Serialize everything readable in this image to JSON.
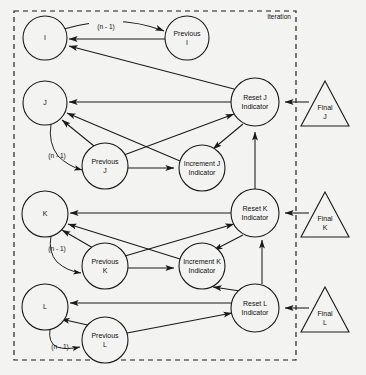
{
  "diagram": {
    "title_label": "Iteration",
    "background_color": "#f3f3f1",
    "stroke_color": "#1a1a1a",
    "type": "flow-network",
    "boundary": {
      "name": "Iteration",
      "x": 14,
      "y": 11,
      "width": 282,
      "height": 349,
      "style": "dashed"
    },
    "nodes": [
      {
        "id": "i",
        "label": "I",
        "shape": "circle",
        "cx": 45,
        "cy": 38,
        "r": 22
      },
      {
        "id": "prev_i",
        "label": "Previous\nI",
        "shape": "circle",
        "cx": 187,
        "cy": 38,
        "r": 22
      },
      {
        "id": "j",
        "label": "J",
        "shape": "circle",
        "cx": 45,
        "cy": 103,
        "r": 22
      },
      {
        "id": "prev_j",
        "label": "Previous\nJ",
        "shape": "circle",
        "cx": 105,
        "cy": 166,
        "r": 23
      },
      {
        "id": "inc_j",
        "label": "Increment J\nIndicator",
        "shape": "circle",
        "cx": 202,
        "cy": 168,
        "r": 23
      },
      {
        "id": "reset_j",
        "label": "Reset J\nIndicator",
        "shape": "circle",
        "cx": 255,
        "cy": 102,
        "r": 24
      },
      {
        "id": "final_j",
        "label": "Final\nJ",
        "shape": "triangle",
        "cx": 325,
        "cy": 104,
        "w": 48,
        "h": 45
      },
      {
        "id": "k",
        "label": "K",
        "shape": "circle",
        "cx": 45,
        "cy": 214,
        "r": 23
      },
      {
        "id": "prev_k",
        "label": "Previous\nK",
        "shape": "circle",
        "cx": 105,
        "cy": 266,
        "r": 23
      },
      {
        "id": "inc_k",
        "label": "Increment K\nIndicator",
        "shape": "circle",
        "cx": 202,
        "cy": 266,
        "r": 23
      },
      {
        "id": "reset_k",
        "label": "Reset K\nIndicator",
        "shape": "circle",
        "cx": 255,
        "cy": 213,
        "r": 24
      },
      {
        "id": "final_k",
        "label": "Final\nK",
        "shape": "triangle",
        "cx": 325,
        "cy": 215,
        "w": 48,
        "h": 45
      },
      {
        "id": "l",
        "label": "L",
        "shape": "circle",
        "cx": 45,
        "cy": 307,
        "r": 23
      },
      {
        "id": "prev_l",
        "label": "Previous\nL",
        "shape": "circle",
        "cx": 105,
        "cy": 340,
        "r": 23
      },
      {
        "id": "reset_l",
        "label": "Reset L\nIndicator",
        "shape": "circle",
        "cx": 255,
        "cy": 308,
        "r": 24
      },
      {
        "id": "final_l",
        "label": "Final\nL",
        "shape": "triangle",
        "cx": 325,
        "cy": 310,
        "w": 48,
        "h": 45
      }
    ],
    "edge_labels": [
      {
        "id": "n1_i",
        "text": "(n - 1)",
        "x": 106,
        "y": 27
      },
      {
        "id": "n1_j",
        "text": "(n - 1)",
        "x": 57,
        "y": 156
      },
      {
        "id": "n1_k",
        "text": "(n - 1)",
        "x": 57,
        "y": 249
      },
      {
        "id": "n1_l",
        "text": "(n - 1)",
        "x": 60,
        "y": 347
      }
    ],
    "edges": [
      {
        "from": "i",
        "to": "prev_i",
        "label": "(n - 1)"
      },
      {
        "from": "prev_i",
        "to": "i",
        "label": ""
      },
      {
        "from": "reset_j",
        "to": "i",
        "label": ""
      },
      {
        "from": "reset_j",
        "to": "j",
        "label": ""
      },
      {
        "from": "j",
        "to": "prev_j",
        "label": "(n - 1)"
      },
      {
        "from": "prev_j",
        "to": "j",
        "label": ""
      },
      {
        "from": "inc_j",
        "to": "j",
        "label": ""
      },
      {
        "from": "prev_j",
        "to": "inc_j",
        "label": ""
      },
      {
        "from": "prev_j",
        "to": "reset_j",
        "label": ""
      },
      {
        "from": "reset_j",
        "to": "inc_j",
        "label": ""
      },
      {
        "from": "final_j",
        "to": "reset_j",
        "label": ""
      },
      {
        "from": "reset_k",
        "to": "reset_j",
        "label": ""
      },
      {
        "from": "reset_k",
        "to": "k",
        "label": ""
      },
      {
        "from": "k",
        "to": "prev_k",
        "label": "(n - 1)"
      },
      {
        "from": "prev_k",
        "to": "k",
        "label": ""
      },
      {
        "from": "inc_k",
        "to": "k",
        "label": ""
      },
      {
        "from": "prev_k",
        "to": "inc_k",
        "label": ""
      },
      {
        "from": "prev_k",
        "to": "reset_k",
        "label": ""
      },
      {
        "from": "reset_k",
        "to": "inc_k",
        "label": ""
      },
      {
        "from": "final_k",
        "to": "reset_k",
        "label": ""
      },
      {
        "from": "reset_l",
        "to": "reset_k",
        "label": ""
      },
      {
        "from": "reset_l",
        "to": "inc_k",
        "label": ""
      },
      {
        "from": "reset_l",
        "to": "l",
        "label": ""
      },
      {
        "from": "l",
        "to": "prev_l",
        "label": "(n - 1)"
      },
      {
        "from": "prev_l",
        "to": "l",
        "label": ""
      },
      {
        "from": "prev_l",
        "to": "reset_l",
        "label": ""
      },
      {
        "from": "final_l",
        "to": "reset_l",
        "label": ""
      }
    ]
  }
}
